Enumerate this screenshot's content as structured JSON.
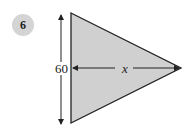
{
  "problem": {
    "number": "6"
  },
  "figure": {
    "shape": "triangle",
    "fill_color": "#d0d0d0",
    "stroke_color": "#222222",
    "vertical_dimension_label": "60",
    "horizontal_dimension_label": "x"
  }
}
